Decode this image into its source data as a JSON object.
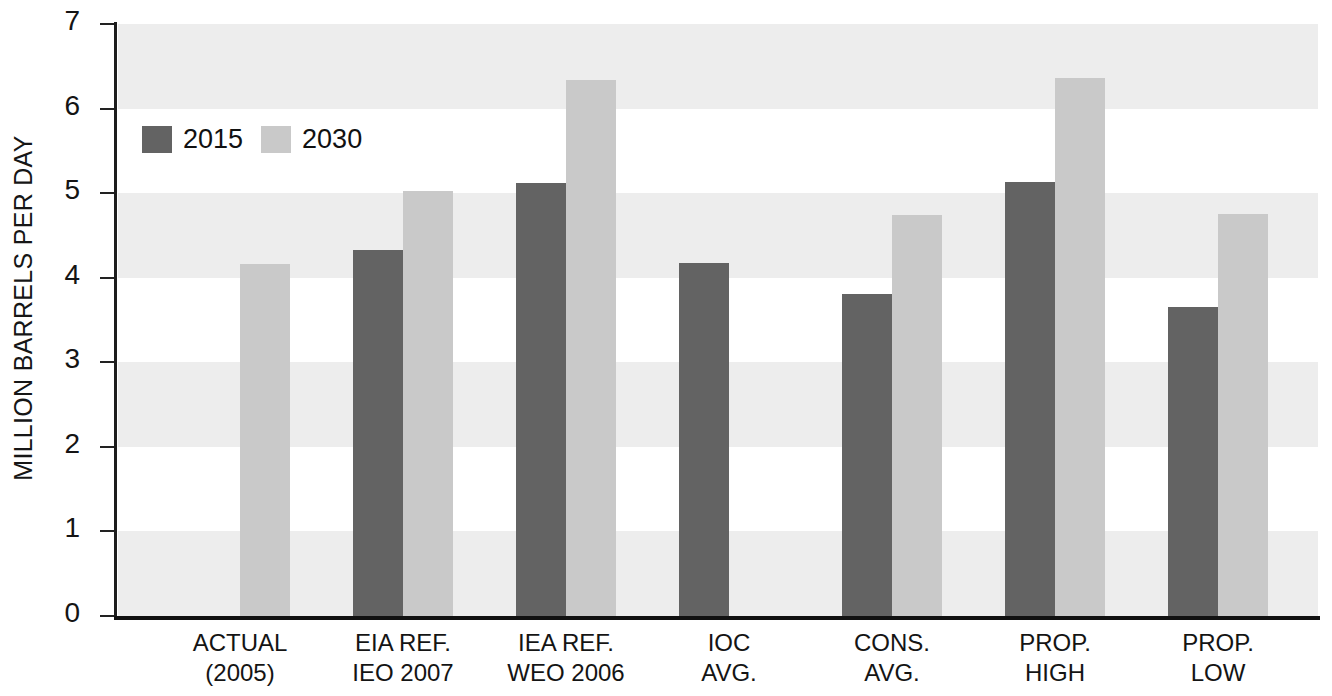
{
  "chart_data": {
    "type": "bar",
    "title": "",
    "xlabel": "",
    "ylabel": "MILLION BARRELS PER DAY",
    "ylim": [
      0,
      7
    ],
    "ytick_labels": [
      "7",
      "6",
      "5",
      "4",
      "3",
      "2",
      "1",
      "0"
    ],
    "ytick_values": [
      7,
      6,
      5,
      4,
      3,
      2,
      1,
      0
    ],
    "grid": false,
    "banded_background": true,
    "legend_position": "upper-left-inside",
    "categories": [
      "ACTUAL\n(2005)",
      "EIA REF.\nIEO 2007",
      "IEA REF.\nWEO 2006",
      "IOC\nAVG.",
      "CONS.\nAVG.",
      "PROP.\nHIGH",
      "PROP.\nLOW"
    ],
    "series": [
      {
        "name": "2015",
        "color": "#636363",
        "values": [
          null,
          4.33,
          5.12,
          4.18,
          3.81,
          5.13,
          3.65
        ]
      },
      {
        "name": "2030",
        "color": "#c9c9c9",
        "values": [
          4.16,
          5.03,
          6.34,
          null,
          4.74,
          6.36,
          4.75
        ]
      }
    ]
  },
  "legend": {
    "items": [
      {
        "label": "2015",
        "color": "#636363"
      },
      {
        "label": "2030",
        "color": "#c9c9c9"
      }
    ]
  },
  "axes": {
    "y_title": "MILLION BARRELS PER DAY"
  },
  "colors": {
    "series_2015": "#636363",
    "series_2030": "#c9c9c9",
    "band": "#ededed",
    "axis": "#111111",
    "text": "#141414",
    "background": "#ffffff"
  }
}
